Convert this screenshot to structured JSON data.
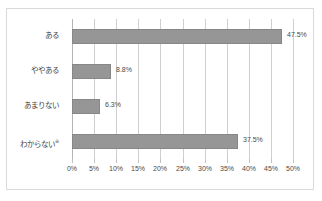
{
  "chart_data": {
    "type": "bar",
    "orientation": "horizontal",
    "title": "",
    "xlabel": "",
    "ylabel": "",
    "xlim": [
      0,
      50
    ],
    "xtick_step": 5,
    "grid": true,
    "legend": false,
    "categories": [
      "ある",
      "ややある",
      "あまりない",
      "わからない"
    ],
    "values": [
      47.5,
      8.8,
      6.3,
      37.5
    ],
    "data_labels": [
      "47.5%",
      "8.8%",
      "6.3%",
      "37.5%"
    ],
    "xtick_labels": [
      "0%",
      "5%",
      "10%",
      "15%",
      "20%",
      "25%",
      "30%",
      "35%",
      "40%",
      "45%",
      "50%"
    ],
    "xtick_values": [
      0,
      5,
      10,
      15,
      20,
      25,
      30,
      35,
      40,
      45,
      50
    ],
    "bar_color": "#969696",
    "bar_border_color": "#878787",
    "gridline_color": "#cfcfcf",
    "axis_color": "#b5b5b5",
    "frame_color": "#d9d9d9",
    "text_color": "#4a4a4a",
    "background": "#ffffff",
    "category_notes": [
      "",
      "",
      "",
      "※"
    ]
  }
}
